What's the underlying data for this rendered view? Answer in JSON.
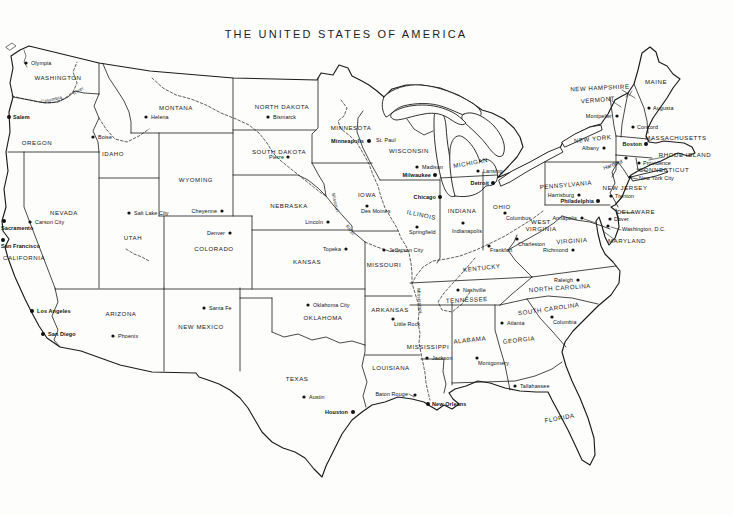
{
  "title": "THE UNITED STATES OF AMERICA",
  "map": {
    "states": [
      {
        "n": "WASHINGTON",
        "x": 58,
        "y": 80
      },
      {
        "n": "OREGON",
        "x": 37,
        "y": 145
      },
      {
        "n": "CALIFORNIA",
        "x": 24,
        "y": 260
      },
      {
        "n": "NEVADA",
        "x": 64,
        "y": 215
      },
      {
        "n": "IDAHO",
        "x": 113,
        "y": 156
      },
      {
        "n": "MONTANA",
        "x": 176,
        "y": 110
      },
      {
        "n": "WYOMING",
        "x": 196,
        "y": 182
      },
      {
        "n": "UTAH",
        "x": 133,
        "y": 240
      },
      {
        "n": "ARIZONA",
        "x": 121,
        "y": 316
      },
      {
        "n": "NEW MEXICO",
        "x": 201,
        "y": 329
      },
      {
        "n": "COLORADO",
        "x": 214,
        "y": 251
      },
      {
        "n": "NORTH DAKOTA",
        "x": 282,
        "y": 109
      },
      {
        "n": "SOUTH DAKOTA",
        "x": 279,
        "y": 154
      },
      {
        "n": "NEBRASKA",
        "x": 289,
        "y": 208
      },
      {
        "n": "KANSAS",
        "x": 307,
        "y": 264
      },
      {
        "n": "OKLAHOMA",
        "x": 323,
        "y": 320
      },
      {
        "n": "TEXAS",
        "x": 297,
        "y": 381
      },
      {
        "n": "MINNESOTA",
        "x": 351,
        "y": 130
      },
      {
        "n": "IOWA",
        "x": 367,
        "y": 197
      },
      {
        "n": "MISSOURI",
        "x": 384,
        "y": 267
      },
      {
        "n": "ARKANSAS",
        "x": 390,
        "y": 312
      },
      {
        "n": "LOUISIANA",
        "x": 391,
        "y": 370
      },
      {
        "n": "WISCONSIN",
        "x": 409,
        "y": 153
      },
      {
        "n": "ILLINOIS",
        "x": 421,
        "y": 217,
        "r": 12
      },
      {
        "n": "MISSISSIPPI",
        "x": 428,
        "y": 349
      },
      {
        "n": "MICHIGAN",
        "x": 471,
        "y": 165,
        "r": -10
      },
      {
        "n": "INDIANA",
        "x": 462,
        "y": 213
      },
      {
        "n": "OHIO",
        "x": 502,
        "y": 209
      },
      {
        "n": "KENTUCKY",
        "x": 482,
        "y": 270,
        "r": -6
      },
      {
        "n": "TENNESSEE",
        "x": 467,
        "y": 302,
        "r": -3
      },
      {
        "n": "ALABAMA",
        "x": 470,
        "y": 342,
        "r": -6
      },
      {
        "n": "GEORGIA",
        "x": 519,
        "y": 342,
        "r": -6
      },
      {
        "n": "FLORIDA",
        "x": 560,
        "y": 420,
        "r": -10
      },
      {
        "n": "SOUTH CAROLINA",
        "x": 549,
        "y": 311,
        "r": -8
      },
      {
        "n": "NORTH CAROLINA",
        "x": 560,
        "y": 290,
        "r": -4
      },
      {
        "n": "VIRGINIA",
        "x": 572,
        "y": 243,
        "r": -4
      },
      {
        "n": "WEST",
        "x": 541,
        "y": 224
      },
      {
        "n": "VIRGINIA",
        "x": 541,
        "y": 231
      },
      {
        "n": "PENNSYLVANIA",
        "x": 566,
        "y": 187,
        "r": -5
      },
      {
        "n": "NEW YORK",
        "x": 593,
        "y": 141,
        "r": -6
      },
      {
        "n": "NEW JERSEY",
        "x": 625,
        "y": 190
      },
      {
        "n": "DELAWARE",
        "x": 636,
        "y": 214
      },
      {
        "n": "MARYLAND",
        "x": 627,
        "y": 243
      },
      {
        "n": "MAINE",
        "x": 656,
        "y": 84
      },
      {
        "n": "VERMONT",
        "x": 598,
        "y": 102,
        "r": -5
      },
      {
        "n": "NEW HAMPSHIRE",
        "x": 600,
        "y": 90,
        "r": -3
      },
      {
        "n": "MASSACHUSETTS",
        "x": 676,
        "y": 140
      },
      {
        "n": "RHODE ISLAND",
        "x": 685,
        "y": 157
      },
      {
        "n": "CONNECTICUT",
        "x": 664,
        "y": 172
      }
    ],
    "cities": [
      {
        "n": "Olympia",
        "d": [
          26,
          63
        ],
        "l": [
          31,
          65
        ],
        "a": "start"
      },
      {
        "n": "Salem",
        "d": [
          9,
          117
        ],
        "l": [
          13,
          119
        ],
        "a": "start",
        "b": true
      },
      {
        "n": "Boise",
        "d": [
          93,
          137
        ],
        "l": [
          98,
          139
        ],
        "a": "start"
      },
      {
        "n": "Helena",
        "d": [
          146,
          117
        ],
        "l": [
          151,
          119
        ],
        "a": "start"
      },
      {
        "n": "Carson City",
        "d": [
          30,
          222
        ],
        "l": [
          35,
          224
        ],
        "a": "start"
      },
      {
        "n": "Sacramento",
        "d": [
          4,
          221
        ],
        "l": [
          1,
          230
        ],
        "a": "start",
        "b": true
      },
      {
        "n": "San Francisco",
        "d": [
          3,
          240
        ],
        "l": [
          1,
          248
        ],
        "a": "start",
        "b": true
      },
      {
        "n": "Los Angeles",
        "d": [
          32,
          311
        ],
        "l": [
          37,
          313
        ],
        "a": "start",
        "b": true
      },
      {
        "n": "San Diego",
        "d": [
          43,
          334
        ],
        "l": [
          48,
          336
        ],
        "a": "start",
        "b": true
      },
      {
        "n": "Salt Lake City",
        "d": [
          129,
          213
        ],
        "l": [
          134,
          215
        ],
        "a": "start"
      },
      {
        "n": "Phoenix",
        "d": [
          113,
          336
        ],
        "l": [
          118,
          338
        ],
        "a": "start"
      },
      {
        "n": "Santa Fe",
        "d": [
          204,
          308
        ],
        "l": [
          209,
          310
        ],
        "a": "start"
      },
      {
        "n": "Cheyenne",
        "d": [
          222,
          211
        ],
        "l": [
          217,
          213
        ],
        "a": "end"
      },
      {
        "n": "Denver",
        "d": [
          230,
          233
        ],
        "l": [
          225,
          235
        ],
        "a": "end"
      },
      {
        "n": "Bismarck",
        "d": [
          268,
          117
        ],
        "l": [
          273,
          119
        ],
        "a": "start"
      },
      {
        "n": "Pierre",
        "d": [
          288,
          157
        ],
        "l": [
          284,
          159
        ],
        "a": "end"
      },
      {
        "n": "Lincoln",
        "d": [
          328,
          222
        ],
        "l": [
          323,
          224
        ],
        "a": "end"
      },
      {
        "n": "Topeka",
        "d": [
          346,
          249
        ],
        "l": [
          341,
          251
        ],
        "a": "end"
      },
      {
        "n": "Oklahoma City",
        "d": [
          308,
          305
        ],
        "l": [
          313,
          307
        ],
        "a": "start"
      },
      {
        "n": "Austin",
        "d": [
          304,
          397
        ],
        "l": [
          309,
          399
        ],
        "a": "start"
      },
      {
        "n": "Houston",
        "d": [
          353,
          412
        ],
        "l": [
          348,
          414
        ],
        "a": "end",
        "b": true
      },
      {
        "n": "Minneapolis",
        "d": [
          369,
          141
        ],
        "l": [
          364,
          143
        ],
        "a": "end",
        "b": true
      },
      {
        "n": "St. Paul",
        "d": [
          372,
          140
        ],
        "l": [
          376,
          142
        ],
        "a": "start",
        "nd": true
      },
      {
        "n": "Des Moines",
        "d": [
          367,
          206
        ],
        "l": [
          361,
          213
        ],
        "a": "start"
      },
      {
        "n": "Jefferson City",
        "d": [
          384,
          250
        ],
        "l": [
          389,
          252
        ],
        "a": "start"
      },
      {
        "n": "Little Rock",
        "d": [
          393,
          319
        ],
        "l": [
          394,
          326
        ],
        "a": "start"
      },
      {
        "n": "Baton Rouge",
        "d": [
          415,
          395
        ],
        "l": [
          408,
          396
        ],
        "a": "end"
      },
      {
        "n": "New Orleans",
        "d": [
          428,
          404
        ],
        "l": [
          432,
          406
        ],
        "a": "start",
        "b": true
      },
      {
        "n": "Madison",
        "d": [
          417,
          167
        ],
        "l": [
          422,
          169
        ],
        "a": "start"
      },
      {
        "n": "Milwaukee",
        "d": [
          435,
          175
        ],
        "l": [
          431,
          177
        ],
        "a": "end",
        "b": true
      },
      {
        "n": "Chicago",
        "d": [
          440,
          197
        ],
        "l": [
          436,
          199
        ],
        "a": "end",
        "b": true
      },
      {
        "n": "Springfield",
        "d": [
          417,
          227
        ],
        "l": [
          409,
          234
        ],
        "a": "start"
      },
      {
        "n": "Jackson",
        "d": [
          427,
          358
        ],
        "l": [
          432,
          360
        ],
        "a": "start"
      },
      {
        "n": "Nashville",
        "d": [
          458,
          290
        ],
        "l": [
          463,
          292
        ],
        "a": "start"
      },
      {
        "n": "Frankfort",
        "d": [
          489,
          246
        ],
        "l": [
          490,
          252
        ],
        "a": "start"
      },
      {
        "n": "Indianapolis",
        "d": [
          463,
          223
        ],
        "l": [
          452,
          233
        ],
        "a": "start"
      },
      {
        "n": "Columbus",
        "d": [
          505,
          213
        ],
        "l": [
          506,
          220
        ],
        "a": "start"
      },
      {
        "n": "Lansing",
        "d": [
          478,
          171
        ],
        "l": [
          483,
          173
        ],
        "a": "start"
      },
      {
        "n": "Detroit",
        "d": [
          493,
          183
        ],
        "l": [
          489,
          185
        ],
        "a": "end",
        "b": true
      },
      {
        "n": "Charleston",
        "d": [
          517,
          239
        ],
        "l": [
          518,
          246
        ],
        "a": "start"
      },
      {
        "n": "Montgomery",
        "d": [
          477,
          358
        ],
        "l": [
          478,
          365
        ],
        "a": "start"
      },
      {
        "n": "Atlanta",
        "d": [
          502,
          323
        ],
        "l": [
          507,
          325
        ],
        "a": "start"
      },
      {
        "n": "Tallahassee",
        "d": [
          515,
          386
        ],
        "l": [
          520,
          388
        ],
        "a": "start"
      },
      {
        "n": "Columbia",
        "d": [
          552,
          317
        ],
        "l": [
          553,
          324
        ],
        "a": "start"
      },
      {
        "n": "Raleigh",
        "d": [
          578,
          280
        ],
        "l": [
          573,
          282
        ],
        "a": "end"
      },
      {
        "n": "Richmond",
        "d": [
          573,
          250
        ],
        "l": [
          568,
          252
        ],
        "a": "end"
      },
      {
        "n": "Harrisburg",
        "d": [
          579,
          195
        ],
        "l": [
          574,
          197
        ],
        "a": "end"
      },
      {
        "n": "Philadelphia",
        "d": [
          598,
          201
        ],
        "l": [
          594,
          203
        ],
        "a": "end",
        "b": true
      },
      {
        "n": "Annapolis",
        "d": [
          582,
          218
        ],
        "l": [
          577,
          220
        ],
        "a": "end"
      },
      {
        "n": "Dover",
        "d": [
          610,
          219
        ],
        "l": [
          614,
          221
        ],
        "a": "start"
      },
      {
        "n": "Trenton",
        "d": [
          611,
          196
        ],
        "l": [
          615,
          198
        ],
        "a": "start"
      },
      {
        "n": "Washington, D.C.",
        "d": [
          608,
          226
        ],
        "l": [
          622,
          231
        ],
        "a": "start"
      },
      {
        "n": "Albany",
        "d": [
          604,
          148
        ],
        "l": [
          599,
          150
        ],
        "a": "end"
      },
      {
        "n": "Montpelier",
        "d": [
          617,
          116
        ],
        "l": [
          612,
          118
        ],
        "a": "end"
      },
      {
        "n": "Concord",
        "d": [
          633,
          127
        ],
        "l": [
          637,
          129
        ],
        "a": "start"
      },
      {
        "n": "Augusta",
        "d": [
          649,
          108
        ],
        "l": [
          653,
          110
        ],
        "a": "start"
      },
      {
        "n": "Boston",
        "d": [
          646,
          144
        ],
        "l": [
          642,
          146
        ],
        "a": "end",
        "b": true
      },
      {
        "n": "Providence",
        "d": [
          639,
          163
        ],
        "l": [
          643,
          165
        ],
        "a": "start"
      },
      {
        "n": "Hartford",
        "d": [
          626,
          158
        ],
        "l": [
          623,
          163
        ],
        "a": "end",
        "r": -20
      },
      {
        "n": "New York City",
        "d": [
          630,
          177
        ],
        "l": [
          639,
          180
        ],
        "a": "start"
      }
    ],
    "river_labels": [
      {
        "n": "Columbia",
        "x": 52,
        "y": 101,
        "r": -12
      },
      {
        "n": "River",
        "x": 79,
        "y": 92,
        "r": -30
      },
      {
        "n": "Missouri",
        "x": 334,
        "y": 203,
        "r": 76
      },
      {
        "n": "River",
        "x": 349,
        "y": 231,
        "r": 55
      },
      {
        "n": "Mississippi",
        "x": 418,
        "y": 301,
        "r": 85
      }
    ],
    "callouts": [
      [
        622,
        90,
        635,
        98
      ],
      [
        629,
        92,
        626,
        97
      ],
      [
        632,
        91,
        629,
        96
      ],
      [
        612,
        101,
        621,
        107
      ],
      [
        653,
        139,
        647,
        142
      ],
      [
        664,
        157,
        649,
        160
      ],
      [
        647,
        171,
        637,
        169
      ],
      [
        634,
        213,
        621,
        212
      ],
      [
        615,
        240,
        603,
        231
      ],
      [
        621,
        230,
        611,
        227
      ],
      [
        638,
        179,
        632,
        178
      ],
      [
        584,
        219,
        596,
        223
      ],
      [
        409,
        394,
        414,
        397
      ]
    ]
  }
}
